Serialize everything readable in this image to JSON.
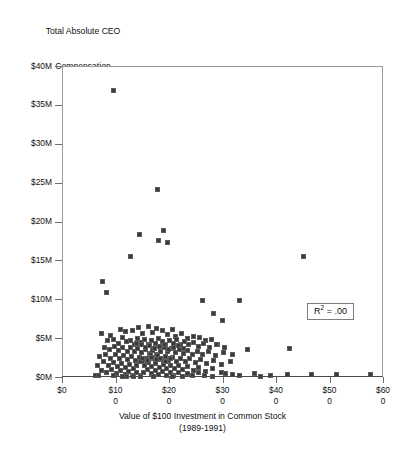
{
  "chart_data": {
    "type": "scatter",
    "title": "Total Absolute CEO Compensation 1989-1991",
    "title_lines": [
      "Total Absolute CEO",
      "Compensation",
      "1989-1991"
    ],
    "xlabel": "Value of $100 Investment in Common Stock (1989-1991)",
    "xlabel_lines": [
      "Value of $100 Investment in Common Stock",
      "(1989-1991)"
    ],
    "ylabel": "",
    "xlim": [
      0,
      600
    ],
    "ylim": [
      0,
      40
    ],
    "y_unit": "$M",
    "x_unit": "$",
    "grid": false,
    "legend": false,
    "annotations": [
      {
        "name": "r-squared",
        "text": "R2 = .00",
        "display_prefix": "R",
        "display_sup": "2",
        "display_suffix": " = .00",
        "x": 470,
        "y": 6.0
      }
    ],
    "xticks": [
      0,
      100,
      200,
      300,
      400,
      500,
      600
    ],
    "xtick_labels": [
      [
        "$0",
        ""
      ],
      [
        "$10",
        "0"
      ],
      [
        "$20",
        "0"
      ],
      [
        "$30",
        "0"
      ],
      [
        "$40",
        "0"
      ],
      [
        "$50",
        "0"
      ],
      [
        "$60",
        "0"
      ]
    ],
    "yticks": [
      0,
      5,
      10,
      15,
      20,
      25,
      30,
      35,
      40
    ],
    "ytick_labels": [
      "$0M",
      "$5M",
      "$10M",
      "$15M",
      "$20M",
      "$25M",
      "$30M",
      "$35M",
      "$40M"
    ],
    "marker": {
      "shape": "square",
      "size_px": 5,
      "fill": "#3a3a3a",
      "edge": "#5d5d5d"
    },
    "series_name": "CEO compensation vs stock value",
    "points": [
      [
        96,
        36.9
      ],
      [
        178,
        24.2
      ],
      [
        143,
        18.4
      ],
      [
        188,
        18.9
      ],
      [
        179,
        17.6
      ],
      [
        196,
        17.4
      ],
      [
        128,
        15.6
      ],
      [
        451,
        15.5
      ],
      [
        75,
        12.4
      ],
      [
        82,
        10.9
      ],
      [
        262,
        9.9
      ],
      [
        330,
        9.9
      ],
      [
        282,
        8.2
      ],
      [
        299,
        7.3
      ],
      [
        73,
        5.6
      ],
      [
        90,
        5.4
      ],
      [
        108,
        6.2
      ],
      [
        118,
        5.9
      ],
      [
        131,
        6.0
      ],
      [
        142,
        6.4
      ],
      [
        150,
        5.6
      ],
      [
        160,
        6.5
      ],
      [
        168,
        5.8
      ],
      [
        175,
        6.3
      ],
      [
        186,
        6.1
      ],
      [
        196,
        5.5
      ],
      [
        205,
        6.2
      ],
      [
        212,
        5.3
      ],
      [
        222,
        5.7
      ],
      [
        233,
        5.0
      ],
      [
        244,
        5.3
      ],
      [
        256,
        5.2
      ],
      [
        268,
        4.7
      ],
      [
        279,
        4.9
      ],
      [
        290,
        4.3
      ],
      [
        84,
        4.7
      ],
      [
        96,
        4.9
      ],
      [
        104,
        4.4
      ],
      [
        112,
        5.1
      ],
      [
        120,
        4.6
      ],
      [
        127,
        4.8
      ],
      [
        134,
        4.3
      ],
      [
        140,
        5.0
      ],
      [
        147,
        4.5
      ],
      [
        154,
        4.9
      ],
      [
        161,
        4.2
      ],
      [
        167,
        4.7
      ],
      [
        173,
        4.4
      ],
      [
        180,
        5.0
      ],
      [
        187,
        4.6
      ],
      [
        193,
        4.1
      ],
      [
        200,
        4.8
      ],
      [
        207,
        4.4
      ],
      [
        214,
        4.9
      ],
      [
        221,
        4.3
      ],
      [
        228,
        4.6
      ],
      [
        236,
        4.2
      ],
      [
        245,
        4.5
      ],
      [
        254,
        4.0
      ],
      [
        264,
        4.4
      ],
      [
        275,
        3.9
      ],
      [
        288,
        4.2
      ],
      [
        303,
        3.8
      ],
      [
        78,
        3.9
      ],
      [
        88,
        3.6
      ],
      [
        97,
        4.0
      ],
      [
        105,
        3.5
      ],
      [
        113,
        3.9
      ],
      [
        121,
        3.4
      ],
      [
        128,
        3.8
      ],
      [
        135,
        3.3
      ],
      [
        141,
        3.7
      ],
      [
        148,
        3.2
      ],
      [
        155,
        3.6
      ],
      [
        162,
        3.1
      ],
      [
        169,
        3.5
      ],
      [
        176,
        3.0
      ],
      [
        183,
        3.4
      ],
      [
        190,
        3.8
      ],
      [
        197,
        3.3
      ],
      [
        204,
        3.7
      ],
      [
        211,
        3.2
      ],
      [
        218,
        3.6
      ],
      [
        226,
        3.1
      ],
      [
        234,
        3.5
      ],
      [
        243,
        3.0
      ],
      [
        252,
        3.4
      ],
      [
        262,
        2.9
      ],
      [
        273,
        3.3
      ],
      [
        286,
        2.8
      ],
      [
        300,
        3.2
      ],
      [
        318,
        2.9
      ],
      [
        70,
        2.7
      ],
      [
        80,
        3.0
      ],
      [
        90,
        2.5
      ],
      [
        99,
        2.9
      ],
      [
        107,
        2.4
      ],
      [
        114,
        2.8
      ],
      [
        122,
        2.3
      ],
      [
        129,
        2.7
      ],
      [
        136,
        2.2
      ],
      [
        143,
        2.6
      ],
      [
        150,
        2.1
      ],
      [
        157,
        2.5
      ],
      [
        164,
        2.9
      ],
      [
        171,
        2.4
      ],
      [
        178,
        2.8
      ],
      [
        185,
        2.3
      ],
      [
        192,
        2.7
      ],
      [
        199,
        2.2
      ],
      [
        206,
        2.6
      ],
      [
        213,
        2.1
      ],
      [
        221,
        2.5
      ],
      [
        229,
        2.0
      ],
      [
        238,
        2.4
      ],
      [
        248,
        1.9
      ],
      [
        258,
        2.3
      ],
      [
        269,
        1.8
      ],
      [
        282,
        2.2
      ],
      [
        297,
        1.7
      ],
      [
        314,
        2.1
      ],
      [
        66,
        1.6
      ],
      [
        76,
        2.0
      ],
      [
        86,
        1.5
      ],
      [
        95,
        1.9
      ],
      [
        103,
        1.4
      ],
      [
        111,
        1.8
      ],
      [
        118,
        1.3
      ],
      [
        125,
        1.7
      ],
      [
        132,
        1.2
      ],
      [
        139,
        1.6
      ],
      [
        146,
        2.0
      ],
      [
        153,
        1.5
      ],
      [
        160,
        1.9
      ],
      [
        167,
        1.4
      ],
      [
        174,
        1.8
      ],
      [
        181,
        1.3
      ],
      [
        188,
        1.7
      ],
      [
        195,
        1.2
      ],
      [
        202,
        1.6
      ],
      [
        209,
        1.1
      ],
      [
        217,
        1.5
      ],
      [
        225,
        1.0
      ],
      [
        234,
        1.4
      ],
      [
        244,
        0.9
      ],
      [
        255,
        1.3
      ],
      [
        267,
        0.8
      ],
      [
        281,
        1.2
      ],
      [
        298,
        0.7
      ],
      [
        72,
        0.9
      ],
      [
        82,
        0.6
      ],
      [
        92,
        1.0
      ],
      [
        101,
        0.5
      ],
      [
        109,
        0.9
      ],
      [
        117,
        0.4
      ],
      [
        124,
        0.8
      ],
      [
        131,
        0.3
      ],
      [
        138,
        0.7
      ],
      [
        145,
        0.2
      ],
      [
        152,
        0.6
      ],
      [
        159,
        1.0
      ],
      [
        166,
        0.5
      ],
      [
        173,
        0.9
      ],
      [
        180,
        0.4
      ],
      [
        187,
        0.8
      ],
      [
        194,
        0.3
      ],
      [
        201,
        0.7
      ],
      [
        208,
        0.2
      ],
      [
        216,
        0.6
      ],
      [
        224,
        0.1
      ],
      [
        233,
        0.5
      ],
      [
        243,
        0.2
      ],
      [
        254,
        0.6
      ],
      [
        266,
        0.3
      ],
      [
        280,
        0.1
      ],
      [
        163,
        4.1
      ],
      [
        155,
        3.9
      ],
      [
        147,
        4.2
      ],
      [
        139,
        4.4
      ],
      [
        172,
        3.7
      ],
      [
        181,
        4.0
      ],
      [
        190,
        4.3
      ],
      [
        199,
        3.6
      ],
      [
        208,
        3.9
      ],
      [
        217,
        4.1
      ],
      [
        226,
        3.7
      ],
      [
        149,
        2.4
      ],
      [
        158,
        2.2
      ],
      [
        166,
        2.6
      ],
      [
        175,
        2.3
      ],
      [
        184,
        2.5
      ],
      [
        193,
        2.1
      ],
      [
        202,
        2.4
      ],
      [
        120,
        0.1
      ],
      [
        133,
        0.15
      ],
      [
        146,
        0.1
      ],
      [
        170,
        0.12
      ],
      [
        205,
        0.1
      ],
      [
        62,
        0.3
      ],
      [
        68,
        0.2
      ],
      [
        95,
        0.25
      ],
      [
        112,
        0.12
      ],
      [
        345,
        3.6
      ],
      [
        358,
        0.5
      ],
      [
        424,
        3.7
      ],
      [
        421,
        0.35
      ],
      [
        466,
        0.4
      ],
      [
        512,
        0.45
      ],
      [
        576,
        0.4
      ],
      [
        388,
        0.3
      ],
      [
        370,
        0.15
      ],
      [
        318,
        0.4
      ],
      [
        331,
        0.2
      ],
      [
        305,
        0.5
      ]
    ]
  }
}
